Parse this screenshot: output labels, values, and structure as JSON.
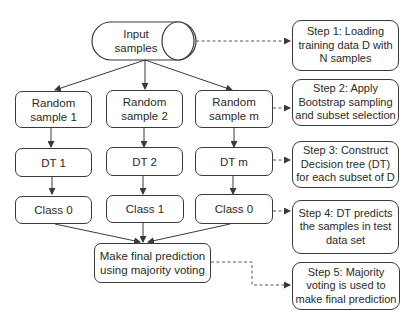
{
  "diagram": {
    "input": {
      "label": "Input\nsamples",
      "shape": "cylinder"
    },
    "samples": [
      {
        "label": "Random\nsample 1"
      },
      {
        "label": "Random\nsample 2"
      },
      {
        "label": "Random\nsample m"
      }
    ],
    "trees": [
      {
        "label": "DT 1"
      },
      {
        "label": "DT 2"
      },
      {
        "label": "DT m"
      }
    ],
    "classes": [
      {
        "label": "Class 0"
      },
      {
        "label": "Class 1"
      },
      {
        "label": "Class 0"
      }
    ],
    "final": {
      "label": "Make final prediction\nusing majority voting"
    },
    "steps": [
      {
        "label": "Step 1: Loading\ntraining data D with\nN samples"
      },
      {
        "label": "Step 2: Apply\nBootstrap sampling\nand subset selection"
      },
      {
        "label": "Step 3: Construct\nDecision tree (DT)\nfor each subset of D"
      },
      {
        "label": "Step 4: DT predicts\nthe samples in test\ndata set"
      },
      {
        "label": "Step 5: Majority\nvoting is used to\nmake final prediction"
      }
    ],
    "edges": {
      "solid": [
        "input->sample1",
        "input->sample2",
        "input->samplem",
        "sample1->dt1",
        "sample2->dt2",
        "samplem->dtm",
        "dt1->class1",
        "dt2->class2",
        "dtm->classm",
        "class1->final",
        "class2->final",
        "classm->final"
      ],
      "dashed": [
        "input->step1",
        "samplem->step2",
        "dtm->step3",
        "classm->step4",
        "final->step5"
      ]
    },
    "colors": {
      "stroke": "#3a3a3a",
      "text": "#2a2a2a",
      "background": "#ffffff"
    }
  }
}
